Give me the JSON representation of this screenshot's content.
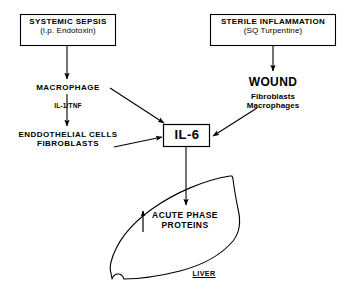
{
  "figure": {
    "stroke_color": "#000000",
    "background_color": "#ffffff"
  },
  "stimuli": {
    "left_box": {
      "line1": "SYSTEMIC SEPSIS",
      "line2": "(i.p. Endotoxin)"
    },
    "right_box": {
      "line1": "STERILE INFLAMMATION",
      "line2": "(SQ Turpentine)"
    }
  },
  "left_cascade": {
    "macrophage": "MACROPHAGE",
    "mediator": "IL-1/TNF",
    "effector_line1": "ENDDOTHELIAL CELLS",
    "effector_line2": "FIBROBLASTS"
  },
  "wound": {
    "heading": "WOUND",
    "cell_line1": "Fibroblasts",
    "cell_line2": "Macrophages"
  },
  "hub": {
    "label": "IL-6"
  },
  "liver": {
    "response_line1": "ACUTE PHASE",
    "response_line2": "PROTEINS",
    "organ_label": "LIVER"
  }
}
